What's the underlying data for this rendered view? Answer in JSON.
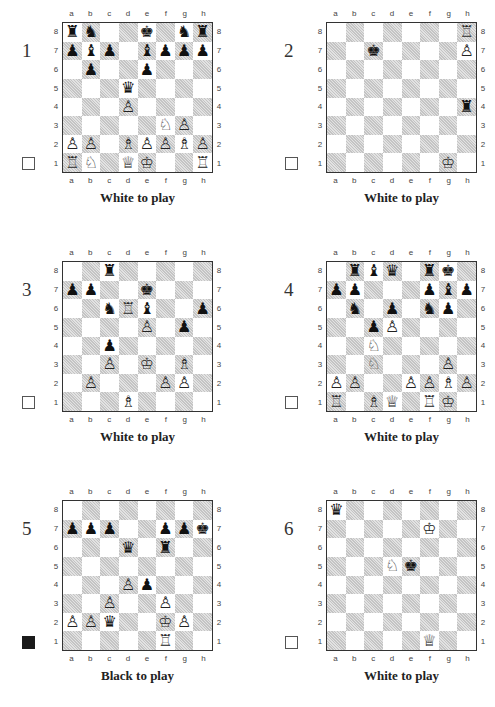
{
  "files": [
    "a",
    "b",
    "c",
    "d",
    "e",
    "f",
    "g",
    "h"
  ],
  "ranks": [
    "8",
    "7",
    "6",
    "5",
    "4",
    "3",
    "2",
    "1"
  ],
  "colors": {
    "dark_square": "#c4c4c4",
    "light_square": "#ffffff",
    "border": "#333333"
  },
  "puzzles": [
    {
      "number": "1",
      "to_move": "White to play",
      "side": "white",
      "pieces": {
        "a8": "bR",
        "b8": "bN",
        "e8": "bK",
        "g8": "bN",
        "h8": "bR",
        "a7": "bP",
        "b7": "bB",
        "c7": "bP",
        "e7": "bB",
        "f7": "bP",
        "g7": "bP",
        "h7": "bP",
        "b6": "bP",
        "e6": "bP",
        "d5": "bQ",
        "d4": "wP",
        "f3": "wN",
        "g3": "wP",
        "a2": "wP",
        "b2": "wP",
        "d2": "wB",
        "e2": "wP",
        "f2": "wP",
        "g2": "wB",
        "h2": "wP",
        "a1": "wR",
        "b1": "wN",
        "d1": "wQ",
        "e1": "wK",
        "h1": "wR"
      }
    },
    {
      "number": "2",
      "to_move": "White to play",
      "side": "white",
      "pieces": {
        "h8": "wR",
        "c7": "bK",
        "h7": "wP",
        "h4": "bR",
        "g1": "wK"
      }
    },
    {
      "number": "3",
      "to_move": "White to play",
      "side": "white",
      "pieces": {
        "c8": "bR",
        "a7": "bP",
        "b7": "bP",
        "e7": "bK",
        "c6": "bN",
        "d6": "wR",
        "e6": "bB",
        "h6": "bP",
        "e5": "wP",
        "g5": "bP",
        "c4": "bP",
        "c3": "wP",
        "e3": "wK",
        "g3": "wB",
        "b2": "wP",
        "f2": "wP",
        "g2": "wP",
        "d1": "wB"
      }
    },
    {
      "number": "4",
      "to_move": "White to play",
      "side": "white",
      "pieces": {
        "b8": "bR",
        "c8": "bB",
        "d8": "bQ",
        "f8": "bR",
        "g8": "bK",
        "a7": "bP",
        "b7": "bP",
        "f7": "bP",
        "g7": "bB",
        "h7": "bP",
        "b6": "bN",
        "d6": "bP",
        "f6": "bN",
        "g6": "bP",
        "c5": "bP",
        "d5": "wP",
        "c4": "wN",
        "c3": "wN",
        "g3": "wP",
        "a2": "wP",
        "b2": "wP",
        "e2": "wP",
        "f2": "wP",
        "g2": "wB",
        "h2": "wP",
        "a1": "wR",
        "c1": "wB",
        "d1": "wQ",
        "f1": "wR",
        "g1": "wK"
      }
    },
    {
      "number": "5",
      "to_move": "Black to play",
      "side": "black",
      "pieces": {
        "a7": "bP",
        "b7": "bP",
        "c7": "bP",
        "f7": "bP",
        "g7": "bP",
        "h7": "bK",
        "d6": "bQ",
        "f6": "bR",
        "d4": "wP",
        "e4": "bP",
        "c3": "wP",
        "f3": "wP",
        "a2": "wP",
        "b2": "wP",
        "c2": "bQ",
        "f2": "wK",
        "g2": "wP",
        "f1": "wR"
      }
    },
    {
      "number": "6",
      "to_move": "White to play",
      "side": "white",
      "pieces": {
        "a8": "bQ",
        "f7": "wK",
        "d5": "wN",
        "e5": "bK",
        "f1": "wQ"
      }
    }
  ],
  "glyphs": {
    "wK": "♔",
    "wQ": "♕",
    "wR": "♖",
    "wB": "♗",
    "wN": "♘",
    "wP": "♙",
    "bK": "♚",
    "bQ": "♛",
    "bR": "♜",
    "bB": "♝",
    "bN": "♞",
    "bP": "♟"
  }
}
